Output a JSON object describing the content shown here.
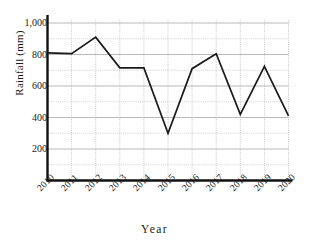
{
  "chart_data": {
    "type": "line",
    "title": "",
    "xlabel": "Year",
    "ylabel": "Rainfall (mm)",
    "categories": [
      "2010",
      "2011",
      "2012",
      "2013",
      "2014",
      "2015",
      "2016",
      "2017",
      "2018",
      "2019",
      "2020"
    ],
    "values": [
      810,
      805,
      910,
      715,
      715,
      300,
      710,
      805,
      420,
      725,
      410
    ],
    "series": [
      {
        "name": "Rainfall",
        "values": [
          810,
          805,
          910,
          715,
          715,
          300,
          710,
          805,
          420,
          725,
          410
        ]
      }
    ],
    "ylim": [
      0,
      1000
    ],
    "xlim": [
      "2010",
      "2020"
    ],
    "y_ticks": [
      200,
      400,
      600,
      800,
      1000
    ],
    "y_tick_labels": [
      "200",
      "400",
      "600",
      "800",
      "1,000"
    ],
    "y_minor_step": 100,
    "x_ticks": [
      "2010",
      "2011",
      "2012",
      "2013",
      "2014",
      "2015",
      "2016",
      "2017",
      "2018",
      "2019",
      "2020"
    ],
    "grid": true,
    "legend": "none",
    "line_color": "#1a1a1a",
    "grid_color": "#9a9a9a",
    "axis_color": "#111111",
    "background": "#ffffff"
  },
  "axis_titles": {
    "x": "Year",
    "y": "Rainfall (mm)"
  }
}
